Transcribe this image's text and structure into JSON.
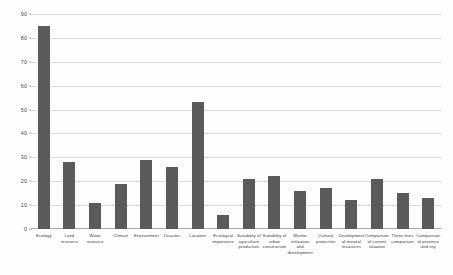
{
  "chart_data": {
    "type": "bar",
    "title": "",
    "xlabel": "",
    "ylabel": "",
    "ylim": [
      0,
      90
    ],
    "grid": true,
    "legend": false,
    "y_ticks": [
      0,
      10,
      20,
      30,
      40,
      50,
      60,
      70,
      80,
      90
    ],
    "bar_color": "#5a5a5a",
    "grid_color": "#d9d9d9",
    "axis_color": "#a6a6a6",
    "categories": [
      "Ecology",
      "Land resource",
      "Water resource",
      "Climate",
      "Environment",
      "Disaster",
      "Location",
      "Ecological importance",
      "Suitability of agriculture production",
      "Suitability of urban construction",
      "Marine utilization and development",
      "Cultural protection",
      "Development of mineral resources",
      "Comparison of current situation",
      "Three-lines comparison",
      "Comparison of province and city"
    ],
    "values": [
      85,
      28,
      11,
      19,
      29,
      26,
      53,
      6,
      21,
      22,
      16,
      17,
      12,
      21,
      15,
      13
    ]
  }
}
